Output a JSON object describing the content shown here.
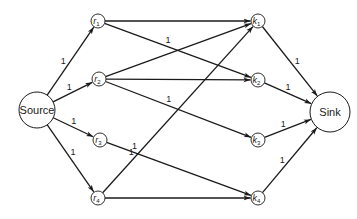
{
  "diagram": {
    "type": "flow-network",
    "nodes": [
      {
        "id": "source",
        "label": "Source",
        "kind": "terminal"
      },
      {
        "id": "r1",
        "letter": "r",
        "sub": "1",
        "kind": "left"
      },
      {
        "id": "r2",
        "letter": "r",
        "sub": "2",
        "kind": "left"
      },
      {
        "id": "r3",
        "letter": "r",
        "sub": "3",
        "kind": "left"
      },
      {
        "id": "r4",
        "letter": "r",
        "sub": "4",
        "kind": "left"
      },
      {
        "id": "k1",
        "letter": "k",
        "sub": "1",
        "kind": "right"
      },
      {
        "id": "k2",
        "letter": "k",
        "sub": "2",
        "kind": "right"
      },
      {
        "id": "k3",
        "letter": "k",
        "sub": "3",
        "kind": "right"
      },
      {
        "id": "k4",
        "letter": "k",
        "sub": "4",
        "kind": "right"
      },
      {
        "id": "sink",
        "label": "Sink",
        "kind": "terminal"
      }
    ],
    "edges": [
      {
        "from": "source",
        "to": "r1",
        "capacity": "1",
        "show_label": true
      },
      {
        "from": "source",
        "to": "r2",
        "capacity": "1",
        "show_label": true
      },
      {
        "from": "source",
        "to": "r3",
        "capacity": "1",
        "show_label": true
      },
      {
        "from": "source",
        "to": "r4",
        "capacity": "1",
        "show_label": true
      },
      {
        "from": "r1",
        "to": "k1",
        "capacity": "1",
        "show_label": false
      },
      {
        "from": "r1",
        "to": "k2",
        "capacity": "1",
        "show_label": true
      },
      {
        "from": "r2",
        "to": "k1",
        "capacity": "1",
        "show_label": false
      },
      {
        "from": "r2",
        "to": "k2",
        "capacity": "1",
        "show_label": false
      },
      {
        "from": "r2",
        "to": "k3",
        "capacity": "1",
        "show_label": true
      },
      {
        "from": "r3",
        "to": "k4",
        "capacity": "1",
        "show_label": true
      },
      {
        "from": "r4",
        "to": "k1",
        "capacity": "1",
        "show_label": true
      },
      {
        "from": "r4",
        "to": "k4",
        "capacity": "1",
        "show_label": false
      },
      {
        "from": "k1",
        "to": "sink",
        "capacity": "1",
        "show_label": true
      },
      {
        "from": "k2",
        "to": "sink",
        "capacity": "1",
        "show_label": true
      },
      {
        "from": "k3",
        "to": "sink",
        "capacity": "1",
        "show_label": true
      },
      {
        "from": "k4",
        "to": "sink",
        "capacity": "1",
        "show_label": true
      }
    ]
  }
}
